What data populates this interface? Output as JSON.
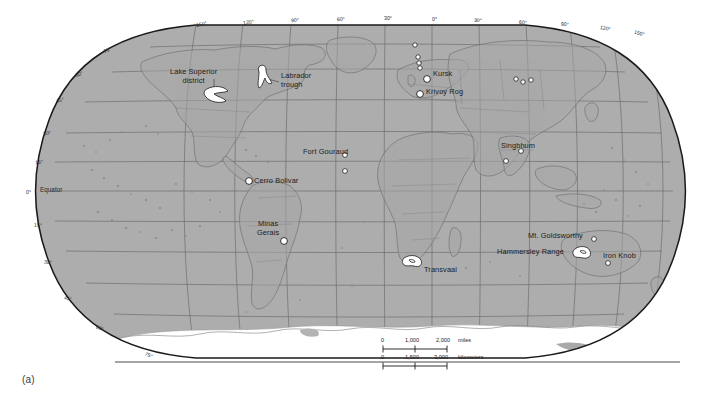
{
  "figure": {
    "caption": "(a)",
    "projection": "robinson",
    "colors": {
      "land_ocean_fill": "#adadad",
      "antarctica_fill": "#ffffff",
      "graticule": "#6e6e6e",
      "coastline": "#7a7a7a",
      "border_outline": "#1a1a1a",
      "deposit_fill": "#ffffff",
      "deposit_stroke": "#1a1a1a",
      "label_text": "#1c1c1c",
      "page_background": "#ffffff"
    }
  },
  "graticule": {
    "longitude_labels": [
      {
        "text": "150°",
        "x": 196,
        "y": 21
      },
      {
        "text": "120°",
        "x": 243,
        "y": 19
      },
      {
        "text": "90°",
        "x": 291,
        "y": 17
      },
      {
        "text": "60°",
        "x": 337,
        "y": 16
      },
      {
        "text": "30°",
        "x": 384,
        "y": 15
      },
      {
        "text": "0°",
        "x": 432,
        "y": 16
      },
      {
        "text": "30°",
        "x": 474,
        "y": 17
      },
      {
        "text": "60°",
        "x": 519,
        "y": 19
      },
      {
        "text": "90°",
        "x": 561,
        "y": 21
      },
      {
        "text": "120°",
        "x": 600,
        "y": 24
      },
      {
        "text": "150°",
        "x": 636,
        "y": 28
      }
    ],
    "latitude_labels": [
      {
        "text": "75°",
        "x": 103,
        "y": 47
      },
      {
        "text": "60°",
        "x": 75,
        "y": 71
      },
      {
        "text": "45°",
        "x": 56,
        "y": 97
      },
      {
        "text": "30°",
        "x": 43,
        "y": 130
      },
      {
        "text": "15°",
        "x": 35,
        "y": 159
      },
      {
        "text": "0°",
        "x": 28,
        "y": 190
      },
      {
        "text": "Equator",
        "x": 39,
        "y": 188
      },
      {
        "text": "15°",
        "x": 34,
        "y": 222
      },
      {
        "text": "30°",
        "x": 44,
        "y": 259
      },
      {
        "text": "45°",
        "x": 64,
        "y": 295
      },
      {
        "text": "60°",
        "x": 96,
        "y": 325
      },
      {
        "text": "75°",
        "x": 145,
        "y": 353
      }
    ]
  },
  "deposits": {
    "labeled": [
      {
        "name": "Lake Superior district",
        "label_lines": [
          "Lake Superior",
          "district"
        ],
        "label_x": 174,
        "label_y": 70,
        "marker_type": "area",
        "marker_x": 215,
        "marker_y": 93,
        "leader": true
      },
      {
        "name": "Labrador trough",
        "label_lines": [
          "Labrador",
          "trough"
        ],
        "label_x": 281,
        "label_y": 78,
        "marker_type": "area",
        "marker_x": 264,
        "marker_y": 76,
        "leader": true
      },
      {
        "name": "Fort Gouraud",
        "label_lines": [
          "Fort Gouraud"
        ],
        "label_x": 303,
        "label_y": 150,
        "marker_type": "point",
        "marker_x": 345,
        "marker_y": 155,
        "leader": false
      },
      {
        "name": "Cerro Bolivar",
        "label_lines": [
          "Cerro Bolivar"
        ],
        "label_x": 229,
        "label_y": 177,
        "marker_type": "point-large",
        "marker_x": 249,
        "marker_y": 181,
        "leader": false
      },
      {
        "name": "Minas Gerais",
        "label_lines": [
          "Minas",
          "Gerais"
        ],
        "label_x": 259,
        "label_y": 223,
        "marker_type": "point-large",
        "marker_x": 284,
        "marker_y": 241,
        "leader": false
      },
      {
        "name": "Kursk",
        "label_lines": [
          "Kursk"
        ],
        "label_x": 432,
        "label_y": 70,
        "marker_type": "point-large",
        "marker_x": 427,
        "marker_y": 79,
        "leader": false
      },
      {
        "name": "Krivoy Rog",
        "label_lines": [
          "Krivoy Rog"
        ],
        "label_x": 428,
        "label_y": 88,
        "marker_type": "point-large",
        "marker_x": 420,
        "marker_y": 94,
        "leader": false
      },
      {
        "name": "Singbhum",
        "label_lines": [
          "Singbhum"
        ],
        "label_x": 503,
        "label_y": 142,
        "marker_type": "point",
        "marker_x": 521,
        "marker_y": 151,
        "leader": false
      },
      {
        "name": "Transvaal",
        "label_lines": [
          "Transvaal"
        ],
        "label_x": 425,
        "label_y": 268,
        "marker_type": "area",
        "marker_x": 412,
        "marker_y": 261,
        "leader": false
      },
      {
        "name": "Mt. Goldsworthy",
        "label_lines": [
          "Mt. Goldsworthy"
        ],
        "label_x": 528,
        "label_y": 233,
        "marker_type": "point",
        "marker_x": 594,
        "marker_y": 239,
        "leader": false
      },
      {
        "name": "Hammersley Range",
        "label_lines": [
          "Hammersley Range"
        ],
        "label_x": 498,
        "label_y": 251,
        "marker_type": "area",
        "marker_x": 581,
        "marker_y": 252,
        "leader": false
      },
      {
        "name": "Iron Knob",
        "label_lines": [
          "Iron Knob"
        ],
        "label_x": 604,
        "label_y": 254,
        "marker_type": "point",
        "marker_x": 608,
        "marker_y": 263,
        "leader": false
      }
    ],
    "unlabeled_points": [
      {
        "x": 415,
        "y": 45
      },
      {
        "x": 418,
        "y": 57
      },
      {
        "x": 419,
        "y": 63
      },
      {
        "x": 420,
        "y": 68
      },
      {
        "x": 516,
        "y": 79
      },
      {
        "x": 522,
        "y": 82
      },
      {
        "x": 530,
        "y": 80
      },
      {
        "x": 345,
        "y": 155
      },
      {
        "x": 345,
        "y": 171
      },
      {
        "x": 506,
        "y": 161
      }
    ]
  },
  "scalebar": {
    "miles": {
      "ticks": [
        "0",
        "1,000",
        "2,000"
      ],
      "unit": "miles"
    },
    "kilometers": {
      "ticks": [
        "0",
        "1,500",
        "3,000"
      ],
      "unit": "kilometers"
    }
  }
}
